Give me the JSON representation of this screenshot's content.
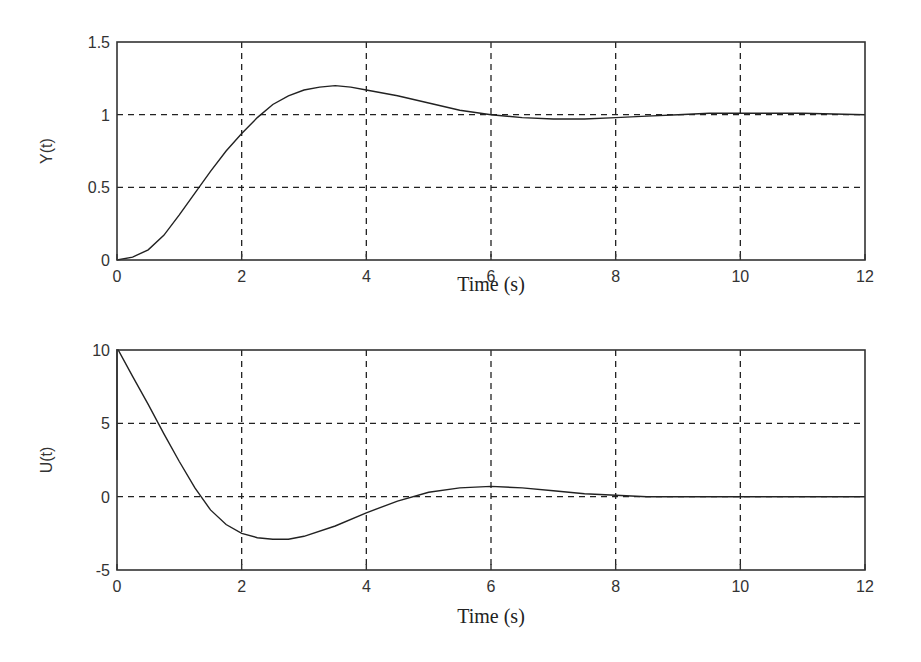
{
  "chart_data": [
    {
      "type": "line",
      "title": "",
      "xlabel": "Time (s)",
      "ylabel": "Y(t)",
      "xlim": [
        0,
        12
      ],
      "ylim": [
        0,
        1.5
      ],
      "xticks": [
        0,
        2,
        4,
        6,
        8,
        10,
        12
      ],
      "yticks": [
        0,
        0.5,
        1,
        1.5
      ],
      "ytick_labels": [
        "0",
        "0.5",
        "1",
        "1.5"
      ],
      "grid": true,
      "series": [
        {
          "name": "Y(t)",
          "x": [
            0,
            0.25,
            0.5,
            0.75,
            1.0,
            1.25,
            1.5,
            1.75,
            2.0,
            2.25,
            2.5,
            2.75,
            3.0,
            3.25,
            3.5,
            3.75,
            4.0,
            4.5,
            5.0,
            5.5,
            6.0,
            6.5,
            7.0,
            7.5,
            8.0,
            8.5,
            9.0,
            9.5,
            10.0,
            11.0,
            12.0
          ],
          "values": [
            0,
            0.02,
            0.07,
            0.17,
            0.31,
            0.46,
            0.61,
            0.75,
            0.87,
            0.98,
            1.07,
            1.13,
            1.17,
            1.19,
            1.2,
            1.19,
            1.17,
            1.13,
            1.08,
            1.03,
            1.0,
            0.98,
            0.97,
            0.97,
            0.98,
            0.99,
            1.0,
            1.01,
            1.01,
            1.01,
            1.0
          ]
        }
      ]
    },
    {
      "type": "line",
      "title": "",
      "xlabel": "Time (s)",
      "ylabel": "U(t)",
      "xlim": [
        0,
        12
      ],
      "ylim": [
        -5,
        10
      ],
      "xticks": [
        0,
        2,
        4,
        6,
        8,
        10,
        12
      ],
      "yticks": [
        -5,
        0,
        5,
        10
      ],
      "ytick_labels": [
        "-5",
        "0",
        "5",
        "10"
      ],
      "grid": true,
      "series": [
        {
          "name": "U(t)",
          "x": [
            0,
            0.0,
            0.02,
            0.25,
            0.5,
            0.75,
            1.0,
            1.25,
            1.5,
            1.75,
            2.0,
            2.25,
            2.5,
            2.75,
            3.0,
            3.5,
            4.0,
            4.5,
            5.0,
            5.5,
            6.0,
            6.5,
            7.0,
            7.5,
            8.0,
            8.5,
            9.0,
            10.0,
            11.0,
            12.0
          ],
          "values": [
            2.5,
            10,
            10,
            8.2,
            6.3,
            4.3,
            2.4,
            0.6,
            -0.9,
            -1.9,
            -2.5,
            -2.8,
            -2.9,
            -2.9,
            -2.7,
            -2.0,
            -1.1,
            -0.3,
            0.3,
            0.6,
            0.7,
            0.6,
            0.4,
            0.2,
            0.1,
            0.0,
            0.0,
            0.0,
            0.0,
            0.0
          ]
        }
      ]
    }
  ],
  "plots": [
    {
      "ylabel": "Y(t)",
      "xlabel": "Time (s)",
      "xtick_labels": [
        "0",
        "2",
        "4",
        "6",
        "8",
        "10",
        "12"
      ],
      "ytick_labels": [
        "0",
        "0.5",
        "1",
        "1.5"
      ]
    },
    {
      "ylabel": "U(t)",
      "xlabel": "Time (s)",
      "xtick_labels": [
        "0",
        "2",
        "4",
        "6",
        "8",
        "10",
        "12"
      ],
      "ytick_labels": [
        "-5",
        "0",
        "5",
        "10"
      ]
    }
  ]
}
